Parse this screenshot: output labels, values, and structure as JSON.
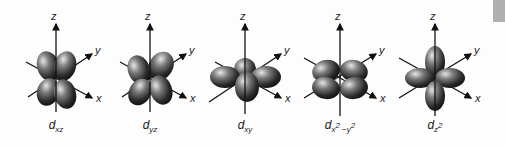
{
  "figure": {
    "axis_labels": {
      "x": "x",
      "y": "y",
      "z": "z"
    },
    "orbitals": [
      {
        "name": "d_xz",
        "base": "d",
        "sub": "xz",
        "cx": 56
      },
      {
        "name": "d_yz",
        "base": "d",
        "sub": "yz",
        "cx": 150
      },
      {
        "name": "d_xy",
        "base": "d",
        "sub": "xy",
        "cx": 245
      },
      {
        "name": "d_x2-y2",
        "base": "d",
        "sub": "x",
        "sup1": "2",
        "sub2": " −y",
        "sup2": "2",
        "cx": 340
      },
      {
        "name": "d_z2",
        "base": "d",
        "sub": "z",
        "sup1": "2",
        "cx": 435
      }
    ]
  }
}
